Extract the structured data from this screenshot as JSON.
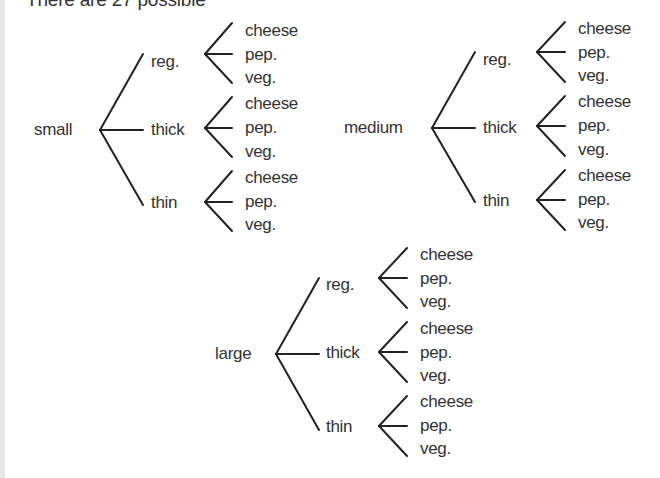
{
  "header": {
    "intro_text": "There are 27 possible"
  },
  "tree": {
    "line_color": "#222222",
    "text_color": "#333333",
    "sizes": [
      {
        "label": "small",
        "crusts": [
          {
            "label": "reg.",
            "toppings": [
              "cheese",
              "pep.",
              "veg."
            ]
          },
          {
            "label": "thick",
            "toppings": [
              "cheese",
              "pep.",
              "veg."
            ]
          },
          {
            "label": "thin",
            "toppings": [
              "cheese",
              "pep.",
              "veg."
            ]
          }
        ]
      },
      {
        "label": "medium",
        "crusts": [
          {
            "label": "reg.",
            "toppings": [
              "cheese",
              "pep.",
              "veg."
            ]
          },
          {
            "label": "thick",
            "toppings": [
              "cheese",
              "pep.",
              "veg."
            ]
          },
          {
            "label": "thin",
            "toppings": [
              "cheese",
              "pep.",
              "veg."
            ]
          }
        ]
      },
      {
        "label": "large",
        "crusts": [
          {
            "label": "reg.",
            "toppings": [
              "cheese",
              "pep.",
              "veg."
            ]
          },
          {
            "label": "thick",
            "toppings": [
              "cheese",
              "pep.",
              "veg."
            ]
          },
          {
            "label": "thin",
            "toppings": [
              "cheese",
              "pep.",
              "veg."
            ]
          }
        ]
      }
    ]
  }
}
